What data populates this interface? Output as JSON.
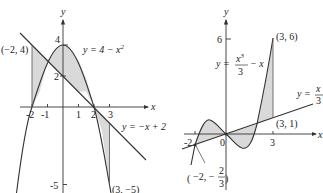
{
  "left_graph": {
    "axis_x_label": "x",
    "axis_y_label": "y",
    "x_ticks": [
      "-2",
      "-1",
      "1",
      "2",
      "3"
    ],
    "y_ticks": [
      "4",
      "2",
      "-5"
    ],
    "curve_label_eq": "y = 4 − x",
    "curve_label_exp": "2",
    "line_label": "y = −x + 2",
    "point_top": "(−2, 4)",
    "point_bottom": "(3, −5)",
    "curves": [
      {
        "name": "parabola",
        "equation": "y = 4 - x^2"
      },
      {
        "name": "line",
        "equation": "y = -x + 2"
      }
    ],
    "shaded_interval": [
      -2,
      3
    ],
    "intersections": [
      [
        -1,
        3
      ],
      [
        2,
        0
      ]
    ]
  },
  "right_graph": {
    "axis_x_label": "x",
    "axis_y_label": "y",
    "x_ticks": [
      "-2",
      "0",
      "3"
    ],
    "y_ticks": [
      "6"
    ],
    "cubic_label_y": "y =",
    "cubic_label_num": "x",
    "cubic_label_exp": "3",
    "cubic_label_den": "3",
    "cubic_label_tail": "− x",
    "line_label_y": "y =",
    "line_label_num": "x",
    "line_label_den": "3",
    "point_top": "(3, 6)",
    "point_right": "(3, 1)",
    "point_left_x": "−2, −",
    "point_left_num": "2",
    "point_left_den": "3",
    "curves": [
      {
        "name": "cubic",
        "equation": "y = x^3/3 - x"
      },
      {
        "name": "line",
        "equation": "y = x/3"
      }
    ],
    "shaded_interval": [
      -2,
      3
    ],
    "intersections": [
      [
        -2,
        -0.667
      ],
      [
        0,
        0
      ],
      [
        2,
        0.667
      ]
    ]
  },
  "colors": {
    "shade": "#d9d9d9",
    "stroke": "#333333",
    "background": "#ffffff"
  }
}
